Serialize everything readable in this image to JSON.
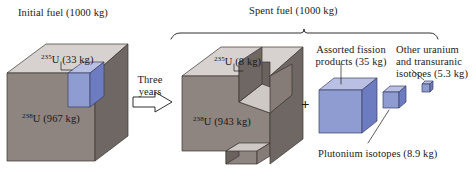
{
  "figure": {
    "title_initial": "Initial fuel (1000 kg)",
    "title_spent": "Spent fuel (1000 kg)",
    "transition_line1": "Three",
    "transition_line2": "years",
    "plus_symbol": "+"
  },
  "initial_fuel": {
    "total_kg": 1000,
    "components": [
      {
        "isotope_superscript": "235",
        "isotope_symbol": "U",
        "label": "U (33 kg)",
        "mass_kg": 33,
        "color": "#8f9cd2"
      },
      {
        "isotope_superscript": "238",
        "isotope_symbol": "U",
        "label": "U (967 kg)",
        "mass_kg": 967,
        "color": "#8e8480"
      }
    ]
  },
  "spent_fuel": {
    "total_kg": 1000,
    "components": [
      {
        "isotope_superscript": "235",
        "isotope_symbol": "U",
        "label": "U (8 kg)",
        "mass_kg": 8,
        "color": "#8e8480"
      },
      {
        "isotope_superscript": "238",
        "isotope_symbol": "U",
        "label": "U (943 kg)",
        "mass_kg": 943,
        "color": "#8e8480"
      }
    ],
    "byproducts": [
      {
        "label": "Assorted fission products (35 kg)",
        "mass_kg": 35,
        "color": "#8f9cd2"
      },
      {
        "label": "Plutonium isotopes (8.9 kg)",
        "mass_kg": 8.9,
        "color": "#8f9cd2"
      },
      {
        "label": "Other uranium and transuranic isotopes (5.3 kg)",
        "mass_kg": 5.3,
        "color": "#8f9cd2"
      }
    ]
  },
  "labels": {
    "u235_left": "U (33 kg)",
    "u235_left_sup": "235",
    "u238_left": "U (967 kg)",
    "u238_left_sup": "238",
    "u235_mid": "U (8 kg)",
    "u235_mid_sup": "235",
    "u238_mid": "U (943 kg)",
    "u238_mid_sup": "238",
    "fission_products": "Assorted fission products (35 kg)",
    "other_isotopes": "Other uranium and transuranic isotopes (5.3 kg)",
    "plutonium": "Plutonium isotopes (8.9 kg)"
  },
  "colors": {
    "gray_top": "#d7d2d0",
    "gray_front": "#8e8480",
    "gray_side": "#6f6763",
    "blue_top": "#b9c0e4",
    "blue_front": "#8f9cd2",
    "blue_side": "#6d7cc0",
    "edge": "#3a3530",
    "background": "#ffffff"
  }
}
